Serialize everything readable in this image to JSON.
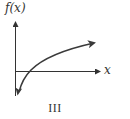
{
  "figure": {
    "y_axis_label": "f(x)",
    "x_axis_label": "x",
    "caption": "III",
    "colors": {
      "axis": "#333333",
      "curve": "#3a3a3a",
      "text": "#333333",
      "background": "#ffffff"
    },
    "curve_description": "increasing concave-down curve (logarithmic shape), vertical asymptote near y-axis, crosses x-axis just right of origin"
  }
}
